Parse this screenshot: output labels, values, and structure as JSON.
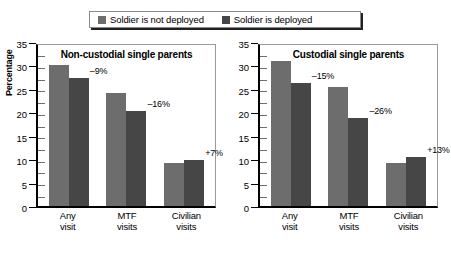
{
  "legend": {
    "entries": [
      {
        "label": "Soldier is not deployed",
        "color": "#6d6d6d"
      },
      {
        "label": "Soldier is deployed",
        "color": "#464646"
      }
    ]
  },
  "axis": {
    "ylabel": "Percentage",
    "ticks": [
      "0",
      "5",
      "10",
      "15",
      "20",
      "25",
      "30",
      "35"
    ]
  },
  "chart_data": [
    {
      "type": "bar",
      "title": "Non-custodial single parents",
      "xlabel": "",
      "ylabel": "Percentage",
      "ylim": [
        0,
        35
      ],
      "ytick_step": 5,
      "grid": false,
      "legend_position": "top",
      "categories": [
        "Any visit",
        "MTF visits",
        "Civilian visits"
      ],
      "category_lines": [
        [
          "Any",
          "visit"
        ],
        [
          "MTF",
          "visits"
        ],
        [
          "Civilian",
          "visits"
        ]
      ],
      "series": [
        {
          "name": "Soldier is not deployed",
          "values": [
            30.0,
            24.1,
            9.2
          ]
        },
        {
          "name": "Soldier is deployed",
          "values": [
            27.3,
            20.3,
            9.85
          ]
        }
      ],
      "annotations": [
        "–9%",
        "–16%",
        "+7%"
      ]
    },
    {
      "type": "bar",
      "title": "Custodial single parents",
      "xlabel": "",
      "ylabel": "Percentage",
      "ylim": [
        0,
        35
      ],
      "ytick_step": 5,
      "grid": false,
      "legend_position": "top",
      "categories": [
        "Any visit",
        "MTF visits",
        "Civilian visits"
      ],
      "category_lines": [
        [
          "Any",
          "visit"
        ],
        [
          "MTF",
          "visits"
        ],
        [
          "Civilian",
          "visits"
        ]
      ],
      "series": [
        {
          "name": "Soldier is not deployed",
          "values": [
            30.9,
            25.4,
            9.2
          ]
        },
        {
          "name": "Soldier is deployed",
          "values": [
            26.2,
            18.8,
            10.4
          ]
        }
      ],
      "annotations": [
        "–15%",
        "–26%",
        "+13%"
      ]
    }
  ]
}
